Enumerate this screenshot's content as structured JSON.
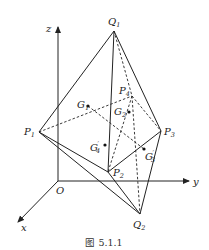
{
  "figure": {
    "caption": "图 5.1.1",
    "axes": {
      "x": "x",
      "y": "y",
      "z": "z",
      "origin": "O"
    },
    "vertices": {
      "Q1": {
        "name": "Q",
        "sub": "1"
      },
      "Q2": {
        "name": "Q",
        "sub": "2"
      },
      "P1": {
        "name": "P",
        "sub": "1"
      },
      "P2": {
        "name": "P",
        "sub": "2"
      },
      "P3": {
        "name": "P",
        "sub": "3"
      },
      "P4": {
        "name": "P",
        "sub": "4"
      }
    },
    "centroids": {
      "G1": {
        "name": "G",
        "sub": "1",
        "prime": ""
      },
      "G2": {
        "name": "G",
        "sub": "2",
        "prime": ""
      },
      "G3p": {
        "name": "G",
        "sub": "3",
        "prime": "′"
      },
      "G4p": {
        "name": "G",
        "sub": "4",
        "prime": "′"
      }
    }
  }
}
